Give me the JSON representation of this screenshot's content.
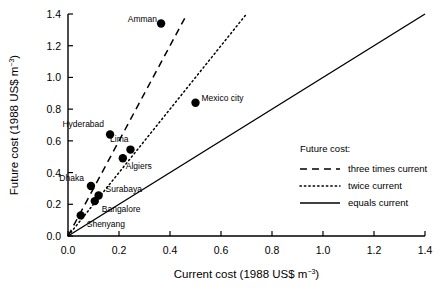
{
  "chart_data": {
    "type": "scatter",
    "title": "",
    "xlabel": "Current cost  (1988 US$ m",
    "xlabel_sup": "−3",
    "xlabel_tail": ")",
    "ylabel": "Future cost  (1988 US$ m",
    "ylabel_sup": "−3",
    "ylabel_tail": ")",
    "xlim": [
      0.0,
      1.4
    ],
    "ylim": [
      0.0,
      1.4
    ],
    "grid": false,
    "xticks": [
      "0.0",
      "0.2",
      "0.4",
      "0.6",
      "0.8",
      "1.0",
      "1.2",
      "1.4"
    ],
    "xtick_values": [
      0.0,
      0.2,
      0.4,
      0.6,
      0.8,
      1.0,
      1.2,
      1.4
    ],
    "yticks": [
      "0.0",
      "0.2",
      "0.4",
      "0.6",
      "0.8",
      "1.0",
      "1.2",
      "1.4"
    ],
    "ytick_values": [
      0.0,
      0.2,
      0.4,
      0.6,
      0.8,
      1.0,
      1.2,
      1.4
    ],
    "points": [
      {
        "label": "Amman",
        "x": 0.365,
        "y": 1.34,
        "lx": -4,
        "ly": -2,
        "anchor": "end"
      },
      {
        "label": "Mexico city",
        "x": 0.5,
        "y": 0.84,
        "lx": 6,
        "ly": -2,
        "anchor": "start"
      },
      {
        "label": "Hyderabad",
        "x": 0.165,
        "y": 0.64,
        "lx": -6,
        "ly": -8,
        "anchor": "end"
      },
      {
        "label": "Lima",
        "x": 0.245,
        "y": 0.545,
        "lx": -2,
        "ly": -8,
        "anchor": "end"
      },
      {
        "label": "Algiers",
        "x": 0.215,
        "y": 0.49,
        "lx": 3,
        "ly": 11,
        "anchor": "start"
      },
      {
        "label": "Dhaka",
        "x": 0.09,
        "y": 0.315,
        "lx": -7,
        "ly": -5,
        "anchor": "end"
      },
      {
        "label": "Surabaya",
        "x": 0.12,
        "y": 0.255,
        "lx": 7,
        "ly": -4,
        "anchor": "start"
      },
      {
        "label": "Bangalore",
        "x": 0.105,
        "y": 0.22,
        "lx": 7,
        "ly": 11,
        "anchor": "start"
      },
      {
        "label": "Shenyang",
        "x": 0.05,
        "y": 0.13,
        "lx": 6,
        "ly": 12,
        "anchor": "start"
      }
    ],
    "reference_lines": [
      {
        "name": "three times current",
        "slope": 3,
        "style": "dashed",
        "x_end": 0.465
      },
      {
        "name": "twice current",
        "slope": 2,
        "style": "dotted",
        "x_end": 0.7
      },
      {
        "name": "equals current",
        "slope": 1,
        "style": "solid",
        "x_end": 1.4
      }
    ],
    "legend": {
      "position": "right-middle",
      "title": "Future cost:",
      "entries": [
        {
          "label": "three times current",
          "style": "dashed"
        },
        {
          "label": "twice current",
          "style": "dotted"
        },
        {
          "label": "equals current",
          "style": "solid"
        }
      ]
    }
  }
}
